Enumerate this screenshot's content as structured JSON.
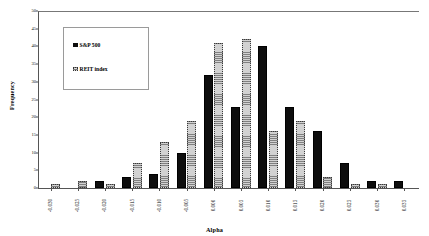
{
  "chart_data": {
    "type": "bar",
    "title": "",
    "xlabel": "Alpha",
    "ylabel": "Frequency",
    "ylim": [
      0,
      50
    ],
    "ytick_step": 5,
    "yticks": [
      "0",
      "5",
      "10",
      "15",
      "20",
      "25",
      "30",
      "35",
      "40",
      "45",
      "50"
    ],
    "grid": false,
    "legend_position": "upper-left-inside",
    "categories": [
      "-0.030",
      "-0.025",
      "-0.020",
      "-0.015",
      "-0.010",
      "-0.005",
      "0.000",
      "0.005",
      "0.010",
      "0.015",
      "0.020",
      "0.025",
      "0.030",
      "0.035"
    ],
    "series": [
      {
        "name": "S&P 500",
        "color": "#0d0d0d",
        "pattern": "solid",
        "values": [
          0,
          0,
          2,
          3,
          4,
          10,
          32,
          23,
          40,
          23,
          16,
          7,
          2,
          2
        ]
      },
      {
        "name": "REIT index",
        "color": "#d2d2d2",
        "pattern": "dotted",
        "values": [
          1,
          2,
          1,
          7,
          13,
          19,
          41,
          42,
          16,
          19,
          3,
          1,
          1,
          0
        ]
      }
    ]
  },
  "legend": {
    "items": [
      {
        "label": "S&P 500"
      },
      {
        "label": "REIT index"
      }
    ]
  },
  "axes": {
    "x_title": "Alpha",
    "y_title": "Frequency"
  }
}
